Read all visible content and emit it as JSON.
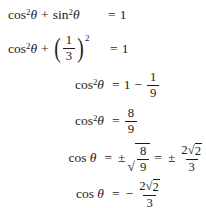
{
  "document": {
    "type": "math-derivation",
    "background_color": "#ffffff",
    "text_color": "#1a1a1a",
    "note": "Six right-aligned derivation steps solving for cos theta from the Pythagorean identity; last line's denominator is clipped by the bottom edge."
  },
  "symbols": {
    "theta": "θ",
    "plus": "+",
    "minus": "−",
    "plus_minus": "±",
    "equals": "=",
    "radical": "√",
    "paren_left": "(",
    "paren_right": ")",
    "exponent_two": "2"
  },
  "equations": [
    {
      "id": "line-1",
      "text": "cos²θ + sin²θ = 1",
      "lhs": {
        "term1_func": "cos",
        "term1_exp": "2",
        "term1_var": "θ",
        "operator": "+",
        "term2_func": "sin",
        "term2_exp": "2",
        "term2_var": "θ"
      },
      "relation": "=",
      "rhs": {
        "value": "1"
      }
    },
    {
      "id": "line-2",
      "text": "cos²θ + (1/3)² = 1",
      "lhs": {
        "term1_func": "cos",
        "term1_exp": "2",
        "term1_var": "θ",
        "operator": "+",
        "paren_left": "(",
        "frac_num": "1",
        "frac_den": "3",
        "paren_right": ")",
        "paren_exp": "2"
      },
      "relation": "=",
      "rhs": {
        "value": "1"
      }
    },
    {
      "id": "line-3",
      "text": "cos²θ = 1 − 1/9",
      "lhs": {
        "term1_func": "cos",
        "term1_exp": "2",
        "term1_var": "θ"
      },
      "relation": "=",
      "rhs": {
        "leading": "1",
        "operator": "−",
        "frac_num": "1",
        "frac_den": "9"
      }
    },
    {
      "id": "line-4",
      "text": "cos²θ = 8/9",
      "lhs": {
        "term1_func": "cos",
        "term1_exp": "2",
        "term1_var": "θ"
      },
      "relation": "=",
      "rhs": {
        "frac_num": "8",
        "frac_den": "9"
      }
    },
    {
      "id": "line-5",
      "text": "cos θ = ±√(8/9) = ± 2√2/3",
      "lhs": {
        "term1_func": "cos",
        "term1_var": "θ"
      },
      "relation": "=",
      "rhs": {
        "sign": "±",
        "radical": "√",
        "radicand_num": "8",
        "radicand_den": "9",
        "relation2": "=",
        "sign2": "±",
        "frac_num_coeff": "2",
        "frac_num_radical": "√",
        "frac_num_radicand": "2",
        "frac_den": "3"
      }
    },
    {
      "id": "line-6",
      "text": "cos θ = − 2√2/3",
      "lhs": {
        "term1_func": "cos",
        "term1_var": "θ"
      },
      "relation": "=",
      "rhs": {
        "sign": "−",
        "frac_num_coeff": "2",
        "frac_num_radical": "√",
        "frac_num_radicand": "2",
        "frac_den": "3"
      }
    }
  ]
}
